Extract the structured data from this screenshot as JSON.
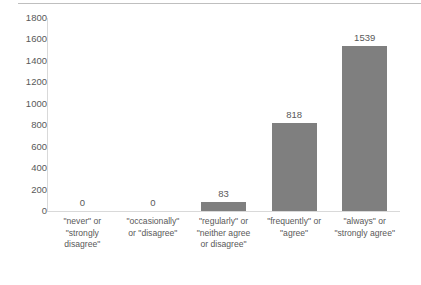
{
  "chart_data": {
    "type": "bar",
    "title": "",
    "xlabel": "",
    "ylabel": "",
    "ylim": [
      0,
      1800
    ],
    "grid": false,
    "legend": "none",
    "bar_color": "#7f7f7f",
    "axis_color": "#d9d9d9",
    "text_color": "#595959",
    "y_ticks": [
      1800,
      1600,
      1400,
      1200,
      1000,
      800,
      600,
      400,
      200,
      0
    ],
    "categories": [
      "\"never\" or \"strongly disagree\"",
      "\"occasionally\" or \"disagree\"",
      "\"regularly\" or \"neither agree or disagree\"",
      "\"frequently\" or \"agree\"",
      "\"always\" or \"strongly agree\""
    ],
    "category_lines": [
      [
        "\"never\" or",
        "\"strongly",
        "disagree\""
      ],
      [
        "\"occasionally\"",
        "or \"disagree\""
      ],
      [
        "\"regularly\" or",
        "\"neither agree",
        "or disagree\""
      ],
      [
        "\"frequently\" or",
        "\"agree\""
      ],
      [
        "\"always\" or",
        "\"strongly agree\""
      ]
    ],
    "values": [
      0,
      0,
      83,
      818,
      1539
    ],
    "value_labels": [
      "0",
      "0",
      "83",
      "818",
      "1539"
    ]
  }
}
